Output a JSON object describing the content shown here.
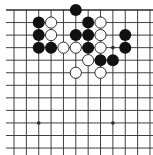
{
  "board": {
    "type": "go-board-partial",
    "view": "top edge visible, left/right/bottom cut",
    "background": "#ffffff",
    "line_color": "#2a2a2a",
    "cols": 12,
    "rows": 12,
    "origin_x": 14,
    "origin_y": 10,
    "spacing_x": 12.36,
    "spacing_y": 12.55,
    "star_points": [
      [
        8,
        3
      ],
      [
        2,
        9
      ],
      [
        8,
        9
      ],
      [
        2,
        3
      ]
    ],
    "stones": {
      "black": [
        [
          5,
          0
        ],
        [
          2,
          1
        ],
        [
          6,
          1
        ],
        [
          2,
          2
        ],
        [
          5,
          2
        ],
        [
          6,
          2
        ],
        [
          9,
          2
        ],
        [
          2,
          3
        ],
        [
          3,
          3
        ],
        [
          6,
          3
        ],
        [
          9,
          3
        ],
        [
          7,
          4
        ],
        [
          8,
          4
        ]
      ],
      "white": [
        [
          3,
          1
        ],
        [
          7,
          1
        ],
        [
          3,
          2
        ],
        [
          7,
          2
        ],
        [
          4,
          3
        ],
        [
          5,
          3
        ],
        [
          7,
          3
        ],
        [
          6,
          4
        ],
        [
          5,
          5
        ],
        [
          7,
          5
        ]
      ]
    },
    "colors": {
      "black_stone": "#111111",
      "white_stone_fill": "#ffffff",
      "white_stone_stroke": "#1a1a1a"
    }
  }
}
